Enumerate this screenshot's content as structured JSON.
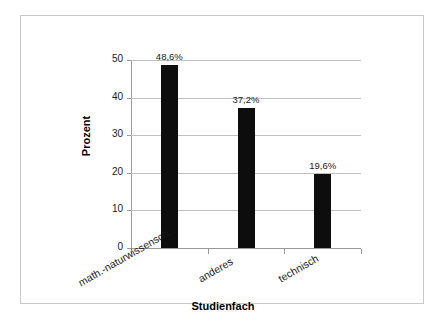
{
  "chart_data": {
    "type": "bar",
    "title": "",
    "subtitle": "",
    "xlabel": "Studienfach",
    "ylabel": "Prozent",
    "categories": [
      "math.-naturwissensch.",
      "anderes",
      "technisch"
    ],
    "values": [
      48.6,
      37.2,
      19.6
    ],
    "data_labels": [
      "48,6%",
      "37,2%",
      "19,6%"
    ],
    "ylim": [
      0,
      50
    ],
    "yticks": [
      0,
      10,
      20,
      30,
      40,
      50
    ],
    "ytick_labels": [
      "0",
      "10",
      "20",
      "30",
      "40",
      "50"
    ],
    "grid": "horizontal",
    "legend": "none",
    "bar_color": "#0d0d0d",
    "gridline_color": "#c0c0c0",
    "axis_color": "#9a9a9a",
    "frame_color": "#c9c9c9",
    "background_color": "#ffffff",
    "category_label_rotation_deg": -30,
    "series": [
      {
        "name": "Prozent",
        "values": [
          48.6,
          37.2,
          19.6
        ]
      }
    ]
  }
}
